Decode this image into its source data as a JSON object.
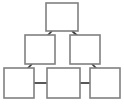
{
  "diagram": {
    "type": "tree",
    "title": "",
    "background_color": "#ffffff",
    "node_fill_color": "#ffffff",
    "node_border_color": "#808080",
    "connector_color": "#3a3a3a",
    "node_count": 6,
    "connector_count": 6,
    "levels": 3,
    "nodes": [
      {
        "id": "node-top",
        "label": "",
        "level": 1,
        "x": 46,
        "y": 3,
        "width": 32,
        "height": 28
      },
      {
        "id": "node-mid-left",
        "label": "",
        "level": 2,
        "x": 25,
        "y": 35,
        "width": 30,
        "height": 29
      },
      {
        "id": "node-mid-right",
        "label": "",
        "level": 2,
        "x": 70,
        "y": 35,
        "width": 30,
        "height": 29
      },
      {
        "id": "node-bottom-left",
        "label": "",
        "level": 3,
        "x": 4,
        "y": 68,
        "width": 30,
        "height": 30
      },
      {
        "id": "node-bottom-center",
        "label": "",
        "level": 3,
        "x": 47,
        "y": 68,
        "width": 33,
        "height": 30
      },
      {
        "id": "node-bottom-right",
        "label": "",
        "level": 3,
        "x": 90,
        "y": 68,
        "width": 30,
        "height": 30
      }
    ],
    "connectors": [
      {
        "id": "connector-top-to-mid-left",
        "from": "node-top",
        "to": "node-mid-left",
        "kind": "diagonal",
        "points": "52,31 45,38"
      },
      {
        "id": "connector-top-to-mid-right",
        "from": "node-top",
        "to": "node-mid-right",
        "kind": "diagonal",
        "points": "72,31 80,38"
      },
      {
        "id": "connector-mid-left-to-bottom-left",
        "from": "node-mid-left",
        "to": "node-bottom-left",
        "kind": "diagonal",
        "points": "32,64 25,71"
      },
      {
        "id": "connector-mid-right-to-bottom-right",
        "from": "node-mid-right",
        "to": "node-bottom-right",
        "kind": "diagonal",
        "points": "92,64 99,71"
      },
      {
        "id": "connector-bottom-left-to-center",
        "from": "node-bottom-left",
        "to": "node-bottom-center",
        "kind": "horizontal",
        "points": "34,83 47,83"
      },
      {
        "id": "connector-bottom-center-to-right",
        "from": "node-bottom-center",
        "to": "node-bottom-right",
        "kind": "horizontal",
        "points": "80,83 90,83"
      }
    ]
  }
}
